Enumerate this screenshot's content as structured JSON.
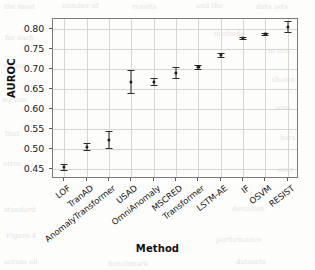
{
  "chart_data": {
    "type": "scatter",
    "title": "",
    "xlabel": "Method",
    "ylabel": "AUROC",
    "categories": [
      "LOF",
      "TranAD",
      "AnomalyTransformer",
      "USAD",
      "OmniAnomaly",
      "MSCRED",
      "Transformer",
      "LSTM-AE",
      "IF",
      "OSVM",
      "RESIST"
    ],
    "values": [
      0.455,
      0.506,
      0.523,
      0.667,
      0.668,
      0.691,
      0.706,
      0.735,
      0.778,
      0.787,
      0.806
    ],
    "error_low": [
      0.447,
      0.497,
      0.503,
      0.64,
      0.659,
      0.678,
      0.7,
      0.729,
      0.776,
      0.785,
      0.793
    ],
    "error_high": [
      0.463,
      0.516,
      0.545,
      0.698,
      0.678,
      0.706,
      0.711,
      0.741,
      0.78,
      0.789,
      0.819
    ],
    "ylim": [
      0.425,
      0.825
    ],
    "yticks": [
      0.45,
      0.5,
      0.55,
      0.6,
      0.65,
      0.7,
      0.75,
      0.8
    ],
    "ytick_labels": [
      "0.45",
      "0.50",
      "0.55",
      "0.60",
      "0.65",
      "0.70",
      "0.75",
      "0.80"
    ],
    "grid": true,
    "legend": false,
    "marker_color": "#1f1f1f",
    "grid_color": "#d6d6d6",
    "axis_color": "#7a7a7a"
  },
  "background_texture": [
    {
      "text": "the most",
      "x": 4,
      "y": 3
    },
    {
      "text": "number of",
      "x": 62,
      "y": 2
    },
    {
      "text": "results",
      "x": 132,
      "y": 3
    },
    {
      "text": "and the",
      "x": 196,
      "y": 2
    },
    {
      "text": "data sets",
      "x": 256,
      "y": 3
    },
    {
      "text": "for each",
      "x": 5,
      "y": 34
    },
    {
      "text": "methods",
      "x": 214,
      "y": 30
    },
    {
      "text": "in this",
      "x": 268,
      "y": 47
    },
    {
      "text": "values",
      "x": 3,
      "y": 62
    },
    {
      "text": "shown",
      "x": 272,
      "y": 76
    },
    {
      "text": "we can",
      "x": 2,
      "y": 96
    },
    {
      "text": "also",
      "x": 276,
      "y": 104
    },
    {
      "text": "that",
      "x": 5,
      "y": 130
    },
    {
      "text": "bars",
      "x": 280,
      "y": 134
    },
    {
      "text": "error",
      "x": 3,
      "y": 160
    },
    {
      "text": "over",
      "x": 278,
      "y": 166
    },
    {
      "text": "standard",
      "x": 4,
      "y": 206
    },
    {
      "text": "deviation",
      "x": 232,
      "y": 205
    },
    {
      "text": "Figure 4",
      "x": 6,
      "y": 232
    },
    {
      "text": "performance",
      "x": 216,
      "y": 236
    },
    {
      "text": "across all",
      "x": 4,
      "y": 258
    },
    {
      "text": "benchmark",
      "x": 108,
      "y": 260
    },
    {
      "text": "datasets",
      "x": 236,
      "y": 258
    }
  ]
}
